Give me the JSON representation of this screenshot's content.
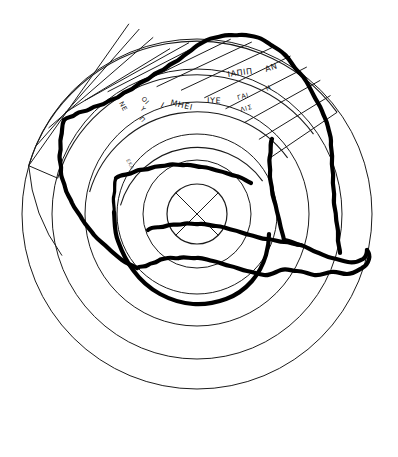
{
  "figure": {
    "background_color": "#ffffff",
    "ink_color": "#1a1a1a",
    "fracture_color": "#000000",
    "width": 398,
    "height": 457
  },
  "geometry": {
    "center_x": 197,
    "center_y": 214,
    "ring_radii": [
      175,
      145,
      112,
      80,
      54,
      30
    ],
    "band_inner_radius": 54,
    "band_outer_radius": 175,
    "band_arc_radii": [
      80,
      112,
      145,
      175
    ],
    "center_disc_radius": 30,
    "cross_glyph": "x-cross-in-circle"
  },
  "inscriptions": {
    "outer_band": [
      {
        "id": "outer-1",
        "text": "ΙΑΠΙΠ",
        "x": 228,
        "y": 77,
        "rotate": -8
      },
      {
        "id": "outer-2",
        "text": "ΑΝ",
        "x": 266,
        "y": 72,
        "rotate": -18
      }
    ],
    "middle_band": [
      {
        "id": "mid-1",
        "text": "ΝΕ",
        "x": 119,
        "y": 103,
        "rotate": 62
      },
      {
        "id": "mid-2",
        "text": "ΟΙ",
        "x": 143,
        "y": 99,
        "rotate": 48
      },
      {
        "id": "mid-3",
        "text": "Υ",
        "x": 143,
        "y": 108,
        "rotate": 48
      },
      {
        "id": "mid-4",
        "text": "Π",
        "x": 143,
        "y": 117,
        "rotate": 48
      },
      {
        "id": "mid-5",
        "text": "Ι",
        "x": 160,
        "y": 106,
        "rotate": 30
      },
      {
        "id": "mid-6",
        "text": "ΜΗΕΙ",
        "x": 171,
        "y": 104,
        "rotate": 14
      },
      {
        "id": "mid-7",
        "text": "ΙΥΕ",
        "x": 208,
        "y": 103,
        "rotate": 2
      },
      {
        "id": "mid-8",
        "text": "ΓΑΙ",
        "x": 240,
        "y": 100,
        "rotate": -14
      },
      {
        "id": "mid-9",
        "text": "ΛΙΣ",
        "x": 243,
        "y": 112,
        "rotate": -14
      },
      {
        "id": "mid-10",
        "text": "Η",
        "x": 268,
        "y": 90,
        "rotate": -26
      }
    ],
    "inner_band": [
      {
        "id": "inner-1",
        "text": "ΕΚΑ",
        "x": 128,
        "y": 160,
        "rotate": 62
      }
    ]
  },
  "sectors": {
    "count": 13,
    "start_angle_deg": -164,
    "end_angle_deg": -16
  }
}
